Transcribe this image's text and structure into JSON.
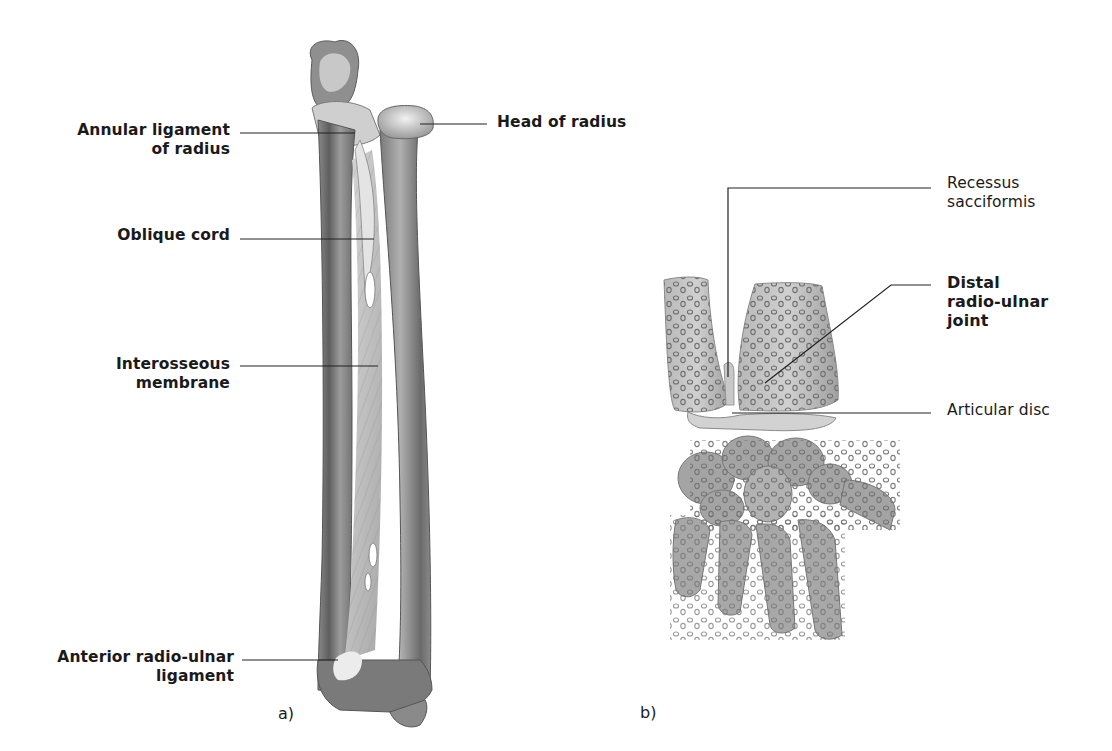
{
  "figure_a": {
    "caption": "a)",
    "labels": {
      "annular_line1": "Annular ligament",
      "annular_line2": "of radius",
      "oblique": "Oblique cord",
      "interosseous_line1": "Interosseous",
      "interosseous_line2": "membrane",
      "anterior_line1": "Anterior radio-ulnar",
      "anterior_line2": "ligament",
      "head_radius": "Head of radius"
    }
  },
  "figure_b": {
    "caption": "b)",
    "labels": {
      "recessus_line1": "Recessus",
      "recessus_line2": "sacciformis",
      "distal_line1": "Distal",
      "distal_line2": "radio-ulnar",
      "distal_line3": "joint",
      "articular": "Articular disc"
    }
  },
  "colors": {
    "bone_dark": "#6e6e6e",
    "bone_mid": "#9a9a9a",
    "bone_light": "#d6d6d6",
    "leader_line": "#222222",
    "text": "#1a1a1a"
  }
}
